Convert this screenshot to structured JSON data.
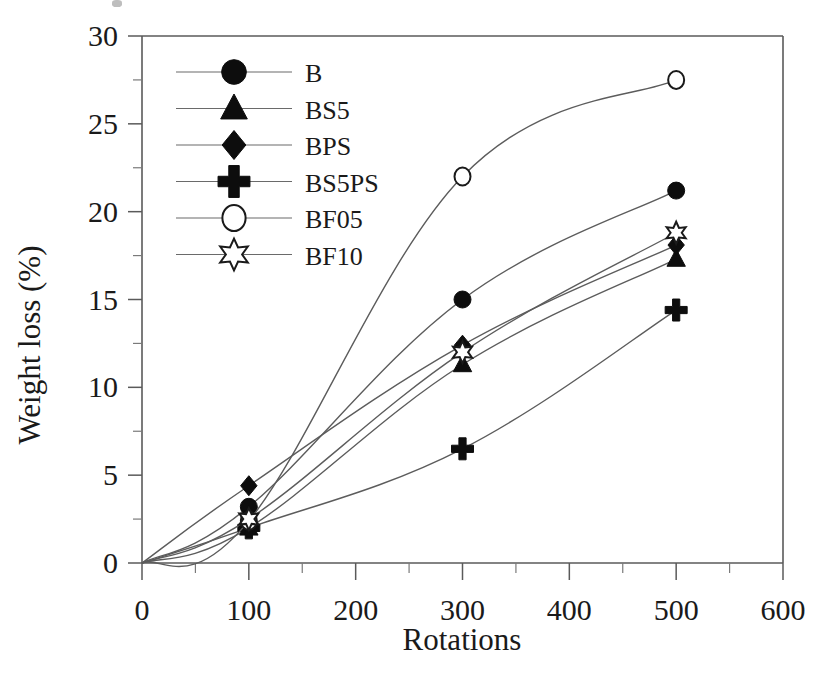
{
  "figure": {
    "background": "#ffffff",
    "ink_color": "#1a1a1a",
    "axis_color": "#5a5a5a"
  },
  "chart_data": {
    "type": "line",
    "title": "",
    "xlabel": "Rotations",
    "ylabel": "Weight loss (%)",
    "xlim": [
      0,
      600
    ],
    "ylim": [
      0,
      30
    ],
    "xticks": [
      0,
      100,
      200,
      300,
      400,
      500,
      600
    ],
    "yticks": [
      0,
      5,
      10,
      15,
      20,
      25,
      30
    ],
    "xtick_labels": [
      "0",
      "100",
      "200",
      "300",
      "400",
      "500",
      "600"
    ],
    "ytick_labels": [
      "0",
      "5",
      "10",
      "15",
      "20",
      "25",
      "30"
    ],
    "x_minor_step": 50,
    "y_minor_step": 2.5,
    "grid": false,
    "legend_position": "upper-left-inside",
    "x": [
      100,
      300,
      500
    ],
    "series": [
      {
        "name": "B",
        "marker": "filled-circle",
        "values": [
          3.2,
          15.0,
          21.2
        ]
      },
      {
        "name": "BS5",
        "marker": "filled-triangle",
        "values": [
          2.0,
          11.3,
          17.3
        ]
      },
      {
        "name": "BPS",
        "marker": "filled-diamond",
        "values": [
          4.4,
          12.4,
          18.1
        ]
      },
      {
        "name": "BS5PS",
        "marker": "filled-plus",
        "values": [
          2.0,
          6.5,
          14.4
        ]
      },
      {
        "name": "BF05",
        "marker": "open-circle",
        "values": [
          2.4,
          22.0,
          27.5
        ]
      },
      {
        "name": "BF10",
        "marker": "open-star",
        "values": [
          2.5,
          12.0,
          18.8
        ]
      }
    ]
  },
  "legend": {
    "entries": [
      {
        "label": "B",
        "icon": "filled-circle-icon"
      },
      {
        "label": "BS5",
        "icon": "filled-triangle-icon"
      },
      {
        "label": "BPS",
        "icon": "filled-diamond-icon"
      },
      {
        "label": "BS5PS",
        "icon": "filled-plus-icon"
      },
      {
        "label": "BF05",
        "icon": "open-circle-icon"
      },
      {
        "label": "BF10",
        "icon": "open-star-icon"
      }
    ]
  }
}
